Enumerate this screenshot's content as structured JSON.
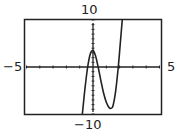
{
  "chart_data": {
    "type": "line",
    "title": "",
    "xlabel": "",
    "ylabel": "",
    "xlim": [
      -5,
      5
    ],
    "ylim": [
      -10,
      10
    ],
    "xscale_tick": 1,
    "yscale_tick": 1,
    "window_labels": {
      "xmin": "−5",
      "xmax": "5",
      "ymin": "−10",
      "ymax": "10"
    },
    "grid": false,
    "legend": "none",
    "series": [
      {
        "name": "f(x)",
        "x": [
          -0.8,
          -0.6,
          -0.4,
          -0.2,
          0.0,
          0.2,
          0.4,
          0.6,
          0.8,
          1.0,
          1.2,
          1.35,
          1.5,
          1.7,
          1.9,
          2.05,
          2.2,
          2.3
        ],
        "y": [
          -10,
          -4.5,
          0,
          2.8,
          3.5,
          2.3,
          -0.2,
          -3.0,
          -5.6,
          -7.5,
          -8.6,
          -8.8,
          -8.3,
          -5.2,
          0,
          5,
          10,
          13
        ]
      }
    ]
  }
}
